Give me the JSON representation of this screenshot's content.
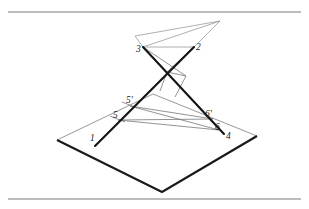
{
  "figure": {
    "background_color": "#ffffff",
    "ink_color": "#1a1a1a",
    "thin_line_color": "#9a9a9a",
    "rule_color": "#7a7a7a",
    "width": 309,
    "height": 209,
    "rules": [
      {
        "name": "top-rule",
        "y": 12
      },
      {
        "name": "bottom-rule",
        "y": 199
      }
    ],
    "plane": {
      "name": "ground-plane",
      "vertices": [
        {
          "label": "left",
          "x": 57,
          "y": 140
        },
        {
          "label": "top",
          "x": 153,
          "y": 94
        },
        {
          "label": "right",
          "x": 257,
          "y": 136
        },
        {
          "label": "bottom",
          "x": 162,
          "y": 192
        }
      ]
    },
    "apex": {
      "name": "pencil-apex",
      "x": 220,
      "y": 21
    },
    "labels": [
      {
        "id": "p1",
        "text": "1",
        "x": 90,
        "y": 141
      },
      {
        "id": "p2",
        "text": "2",
        "x": 196,
        "y": 50
      },
      {
        "id": "p3",
        "text": "3",
        "x": 141,
        "y": 49
      },
      {
        "id": "p4",
        "text": "4",
        "x": 224,
        "y": 137
      },
      {
        "id": "p5",
        "text": "5",
        "x": 116,
        "y": 117
      },
      {
        "id": "p5prime",
        "text": "5'",
        "x": 130,
        "y": 101
      },
      {
        "id": "p6",
        "text": "6",
        "x": 216,
        "y": 127
      },
      {
        "id": "p6prime",
        "text": "6'",
        "x": 207,
        "y": 114
      }
    ],
    "segments": {
      "thick_line_a": {
        "name": "line-1-to-2",
        "from": {
          "x": 95,
          "y": 146
        },
        "to": {
          "x": 194,
          "y": 47
        }
      },
      "thick_line_b": {
        "name": "line-3-to-4",
        "from": {
          "x": 143,
          "y": 47
        },
        "to": {
          "x": 224,
          "y": 134
        }
      }
    }
  }
}
